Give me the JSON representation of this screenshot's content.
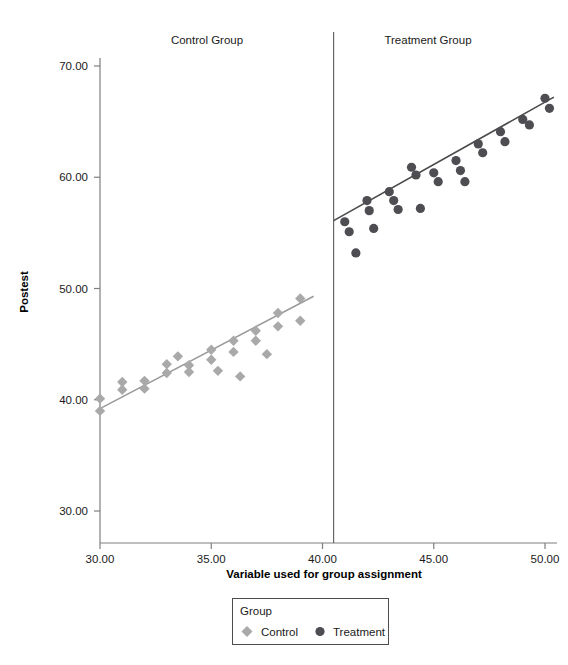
{
  "chart_data": {
    "type": "scatter",
    "title": "",
    "xlabel": "Variable used for group assignment",
    "ylabel": "Postest",
    "xlim": [
      28.8,
      51.0
    ],
    "ylim": [
      28.0,
      71.5
    ],
    "xticks": [
      "30.00",
      "35.00",
      "40.00",
      "45.00",
      "50.00"
    ],
    "xtick_values": [
      30,
      35,
      40,
      45,
      50
    ],
    "yticks": [
      "30.00",
      "40.00",
      "50.00",
      "60.00",
      "70.00"
    ],
    "ytick_values": [
      30,
      40,
      50,
      60,
      70
    ],
    "grid": false,
    "cutoff": 40.5,
    "panels": [
      {
        "name": "control-panel",
        "label": "Control Group",
        "center_x": 35.0
      },
      {
        "name": "treatment-panel",
        "label": "Treatment Group",
        "center_x": 45.5
      }
    ],
    "legend": {
      "title": "Group",
      "position": "bottom",
      "entries": [
        {
          "name": "legend-entry-control",
          "label": "Control",
          "marker": "diamond",
          "color": "#a9a9a9"
        },
        {
          "name": "legend-entry-treatment",
          "label": "Treatment",
          "marker": "circle",
          "color": "#4d4d52"
        }
      ]
    },
    "series": [
      {
        "name": "Control",
        "marker": "diamond",
        "color": "#a9a9a9",
        "points": [
          [
            30.0,
            40.1
          ],
          [
            30.0,
            39.0
          ],
          [
            31.0,
            41.6
          ],
          [
            31.0,
            40.9
          ],
          [
            32.0,
            41.7
          ],
          [
            32.0,
            41.0
          ],
          [
            33.0,
            43.2
          ],
          [
            33.0,
            42.4
          ],
          [
            33.5,
            43.9
          ],
          [
            34.0,
            43.1
          ],
          [
            34.0,
            42.5
          ],
          [
            35.0,
            44.5
          ],
          [
            35.0,
            43.6
          ],
          [
            35.3,
            42.6
          ],
          [
            36.0,
            45.3
          ],
          [
            36.0,
            44.3
          ],
          [
            36.3,
            42.1
          ],
          [
            37.0,
            46.2
          ],
          [
            37.0,
            45.3
          ],
          [
            37.5,
            44.1
          ],
          [
            38.0,
            47.8
          ],
          [
            38.0,
            46.6
          ],
          [
            39.0,
            49.1
          ],
          [
            39.0,
            47.1
          ]
        ],
        "fit_line": {
          "x1": 30.0,
          "y1": 39.2,
          "x2": 39.6,
          "y2": 49.3
        }
      },
      {
        "name": "Treatment",
        "marker": "circle",
        "color": "#4d4d52",
        "points": [
          [
            41.0,
            56.0
          ],
          [
            41.2,
            55.1
          ],
          [
            41.5,
            53.2
          ],
          [
            42.0,
            57.9
          ],
          [
            42.1,
            57.0
          ],
          [
            42.3,
            55.4
          ],
          [
            43.0,
            58.7
          ],
          [
            43.2,
            57.9
          ],
          [
            43.4,
            57.1
          ],
          [
            44.0,
            60.9
          ],
          [
            44.2,
            60.2
          ],
          [
            44.4,
            57.2
          ],
          [
            45.0,
            60.4
          ],
          [
            45.2,
            59.6
          ],
          [
            46.0,
            61.5
          ],
          [
            46.2,
            60.6
          ],
          [
            46.4,
            59.6
          ],
          [
            47.0,
            63.0
          ],
          [
            47.2,
            62.2
          ],
          [
            48.0,
            64.1
          ],
          [
            48.2,
            63.2
          ],
          [
            49.0,
            65.2
          ],
          [
            49.3,
            64.7
          ],
          [
            50.0,
            67.1
          ],
          [
            50.2,
            66.2
          ]
        ],
        "fit_line": {
          "x1": 40.5,
          "y1": 56.1,
          "x2": 50.4,
          "y2": 67.2
        }
      }
    ]
  }
}
